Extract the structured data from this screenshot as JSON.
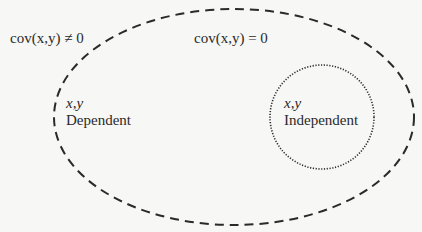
{
  "diagram": {
    "outer_region": {
      "label": "cov(x,y) ≠ 0",
      "shape": "ellipse",
      "border": "dashed",
      "inner_label": "cov(x,y) = 0"
    },
    "dependent": {
      "vars": "x,y",
      "label": "Dependent"
    },
    "independent": {
      "vars": "x,y",
      "label": "Independent",
      "shape": "circle",
      "border": "dotted"
    },
    "colors": {
      "stroke": "#2a2a2a",
      "background": "#f7f7f5"
    }
  }
}
